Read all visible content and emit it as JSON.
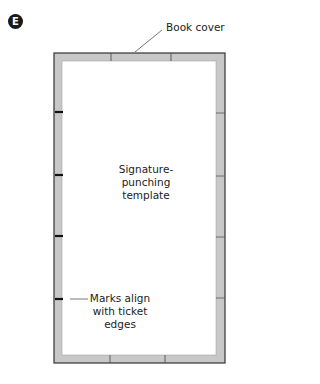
{
  "figure": {
    "badge": "E",
    "labels": {
      "book_cover": "Book cover",
      "template_line1": "Signature-punching",
      "template_line2": "template",
      "marks_line1": "Marks align",
      "marks_line2": "with ticket",
      "marks_line3": "edges"
    },
    "colors": {
      "cover_band": "#c8c8c8",
      "outline": "#333333",
      "mark": "#111111",
      "background": "#ffffff"
    },
    "marks_y": [
      112,
      175,
      236,
      299
    ]
  }
}
